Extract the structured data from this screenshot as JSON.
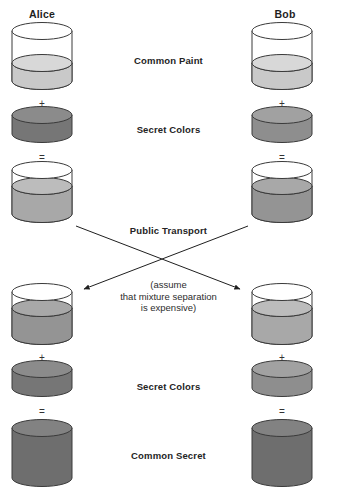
{
  "diagram": {
    "title_parties": {
      "alice": "Alice",
      "bob": "Bob"
    },
    "center_labels": {
      "common_paint": "Common Paint",
      "secret_colors_top": "Secret Colors",
      "public_transport": "Public Transport",
      "secret_colors_bottom": "Secret Colors",
      "common_secret": "Common Secret"
    },
    "note": {
      "line1": "(assume",
      "line2": "that mixture separation",
      "line3": "is expensive)"
    },
    "operators": {
      "plus": "+",
      "equals": "="
    },
    "colors": {
      "outline": "#3a3a3a",
      "glass_empty": "#ffffff",
      "common_paint": "#c9c9c9",
      "common_paint_top": "#d8d8d8",
      "alice_secret": "#767676",
      "alice_secret_top": "#8b8b8b",
      "bob_secret": "#8e8e8e",
      "bob_secret_top": "#a1a1a1",
      "alice_mix": "#a8a8a8",
      "alice_mix_top": "#bcbcbc",
      "bob_mix": "#949494",
      "bob_mix_top": "#a8a8a8",
      "common_secret": "#6e6e6e",
      "common_secret_top": "#828282",
      "arrow": "#1f1f1f",
      "text": "#242424",
      "background": "#ffffff"
    },
    "steps": [
      {
        "row": "common-paint",
        "label": "Common Paint",
        "alice_vessel": "partially-filled-beaker-light-gray",
        "bob_vessel": "partially-filled-beaker-light-gray"
      },
      {
        "row": "secret-colors-top",
        "label": "Secret Colors",
        "alice_vessel": "short-disc-dark-gray",
        "bob_vessel": "short-disc-medium-gray"
      },
      {
        "row": "mixed-public",
        "label": "",
        "alice_vessel": "filled-beaker-alice-mix",
        "bob_vessel": "filled-beaker-bob-mix"
      },
      {
        "row": "public-transport",
        "label": "Public Transport",
        "alice_vessel": "",
        "bob_vessel": ""
      },
      {
        "row": "received-mix",
        "label": "(assume that mixture separation is expensive)",
        "alice_vessel": "filled-beaker-bob-mix",
        "bob_vessel": "filled-beaker-alice-mix"
      },
      {
        "row": "secret-colors-bottom",
        "label": "Secret Colors",
        "alice_vessel": "short-disc-dark-gray",
        "bob_vessel": "short-disc-medium-gray"
      },
      {
        "row": "common-secret",
        "label": "Common Secret",
        "alice_vessel": "full-cylinder-dark-gray",
        "bob_vessel": "full-cylinder-dark-gray"
      }
    ],
    "arrows": [
      {
        "name": "alice-to-bob",
        "from": "alice-mixed-vessel",
        "to": "bob-received-vessel"
      },
      {
        "name": "bob-to-alice",
        "from": "bob-mixed-vessel",
        "to": "alice-received-vessel"
      }
    ]
  }
}
